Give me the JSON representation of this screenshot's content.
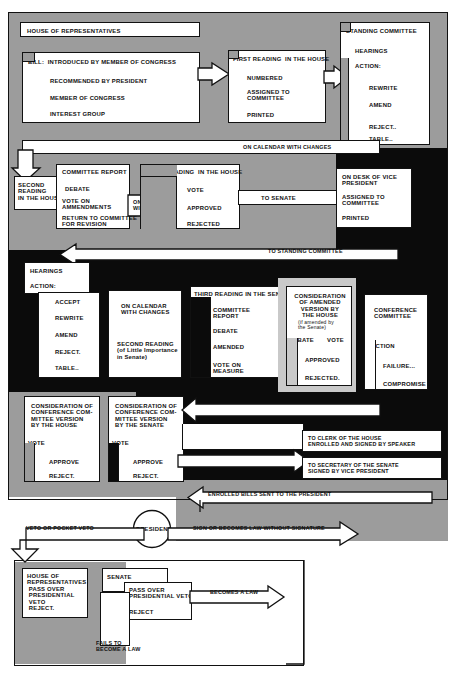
{
  "colors": {
    "gray": "#9c9c9c",
    "black": "#0b0b0b",
    "white": "#ffffff",
    "ink": "#111111"
  },
  "boxes": {
    "house_of_representatives": "HOUSE OF REPRESENTATIVES",
    "bill_title": "BILL:  INTRODUCED BY MEMBER OF CONGRESS",
    "bill_items": [
      "RECOMMENDED BY PRESIDENT",
      "MEMBER OF CONGRESS",
      "INTEREST GROUP"
    ],
    "first_reading_title": "FIRST READING  IN THE HOUSE",
    "first_reading_items": [
      "NUMBERED",
      "ASSIGNED TO\nCOMMITTEE",
      "PRINTED"
    ],
    "standing_committee_title": "STANDING COMMITTEE",
    "standing_committee_sub": [
      "HEARINGS",
      "ACTION:"
    ],
    "standing_committee_actions": [
      "REWRITE",
      "AMEND",
      "REJECT..",
      "TABLE.."
    ],
    "on_calendar_with_changes_1": "ON CALENDAR WITH CHANGES",
    "second_reading_house": "SECOND\nREADING\nIN THE HOUSE",
    "committee_report_title": "COMMITTEE REPORT",
    "committee_report_items": [
      "DEBATE",
      "VOTE ON\nAMMENDMENTS",
      "RETURN TO COMMITTEE\nFOR REVISION"
    ],
    "on_calendar_with_changes_2": "ON CALENDAR\nWITH CHANGES",
    "third_reading_house_title": "THIRD READING  IN THE HOUSE",
    "third_reading_house_items": [
      "VOTE",
      "APPROVED",
      "REJECTED"
    ],
    "to_senate": "TO SENATE",
    "on_desk_vice_president": [
      "ON DESK OF VICE\nPRESIDENT",
      "ASSIGNED TO\nCOMMITTEE",
      "PRINTED"
    ],
    "to_standing_committee": "TO STANDING COMMITTEE",
    "hearings_action_title": [
      "HEARINGS",
      "ACTION:"
    ],
    "senate_committee_actions": [
      "ACCEPT",
      "REWRITE",
      "AMEND",
      "REJECT.",
      "TABLE.."
    ],
    "senate_calendar": [
      "ON CALENDAR\nWITH CHANGES",
      "SECOND READING\n(of Little Importance\nin Senate)"
    ],
    "third_reading_senate_title": "THIRD READING IN THE SENATE",
    "third_reading_senate_items": [
      "COMMITTEE\nREPORT",
      "DEBATE",
      "AMENDED",
      "VOTE ON\nMEASURE"
    ],
    "consideration_amended_title": "CONSIDERATION\nOF AMENDED\nVERSION BY\nTHE HOUSE",
    "consideration_amended_note": "(if amended by\nthe Senate)",
    "consideration_amended_items": [
      "DEBATE",
      "VOTE",
      "APPROVED",
      "REJECTED."
    ],
    "conference_committee_title": "CONFERENCE\nCOMMITTEE",
    "conference_committee_items": [
      "ACTION",
      "FAILURE...",
      "COMPROMISE"
    ],
    "cons_conf_house": "CONSIDERATION OF\nCONFERENCE COM-\nMITTEE VERSION\nBY THE HOUSE",
    "cons_conf_senate": "CONSIDERATION OF\nCONFERENCE COM-\nMITTEE VERSION\nBY THE SENATE",
    "vote_label": "VOTE",
    "approve_label": "APPROVE",
    "reject_label": "REJECT.",
    "to_clerk_house": "TO CLERK OF THE HOUSE\nENROLLED AND SIGNED BY SPEAKER",
    "to_secretary_senate": "TO SECRETARY OF THE SENATE\nSIGNED BY VICE PRESIDENT",
    "enrolled_bills_sent": "ENROLLED BILLS SENT TO THE PRESIDENT",
    "president": "PRESIDENT",
    "veto_or_pocket_veto": "VETO OR POCKET VETO",
    "sign_or_becomes_law": "SIGN OR BECOMES LAW WITHOUT SIGNATURE",
    "house_pass_over": "HOUSE OF\nREPRESENTATIVES\n PASS OVER\n PRESIDENTIAL\n VETO\n REJECT.",
    "senate_label": "SENATE",
    "senate_pass_over": "PASS OVER\nPRESIDENTIAL VETO",
    "senate_reject": "REJECT",
    "becomes_a_law": "BECOMES A LAW",
    "fails_to_become_law": "FAILS TO\nBECOME A LAW"
  }
}
